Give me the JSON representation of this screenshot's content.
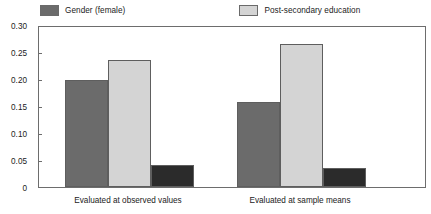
{
  "chart_data": {
    "type": "bar",
    "title": "",
    "subtitle": "",
    "xlabel": "",
    "ylabel": "",
    "ylim": [
      0,
      0.3
    ],
    "grid": false,
    "legend_position": "top",
    "ytick_labels": [
      "0.30",
      "0.25",
      "0.20",
      "0.15",
      "0.10",
      "0.05",
      "0"
    ],
    "ytick_values": [
      0.3,
      0.25,
      0.2,
      0.15,
      0.1,
      0.05,
      0
    ],
    "categories": [
      "Evaluated at observed values",
      "Evaluated at sample means"
    ],
    "series": [
      {
        "name": "Gender (female)",
        "color": "#6b6b6b",
        "values": [
          0.199,
          0.157
        ]
      },
      {
        "name": "Post-secondary education",
        "color": "#d4d4d4",
        "values": [
          0.235,
          0.265
        ]
      },
      {
        "name": "Urban place of residence",
        "color": "#2b2b2b",
        "values": [
          0.041,
          0.035
        ]
      }
    ]
  },
  "colors": {
    "axis": "#6d6d6d",
    "text": "#1b1b1b",
    "background": "#ffffff",
    "bar_border": "#5e5e5e"
  }
}
